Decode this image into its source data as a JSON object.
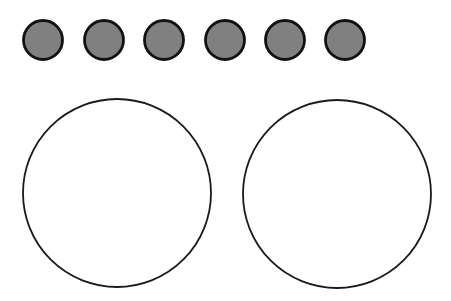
{
  "canvas": {
    "width": 451,
    "height": 301,
    "background": "#ffffff"
  },
  "colors": {
    "small_fill": "#808080",
    "small_stroke": "#111111",
    "large_fill": "#ffffff",
    "large_stroke": "#1a1a1a"
  },
  "small_circles": [
    {
      "cx": 43,
      "cy": 40,
      "r": 19.5
    },
    {
      "cx": 104,
      "cy": 40,
      "r": 19.5
    },
    {
      "cx": 164,
      "cy": 40,
      "r": 19.5
    },
    {
      "cx": 225,
      "cy": 40,
      "r": 19.5
    },
    {
      "cx": 285,
      "cy": 40,
      "r": 19.5
    },
    {
      "cx": 345,
      "cy": 40,
      "r": 19.5
    }
  ],
  "large_circles": [
    {
      "cx": 117,
      "cy": 193,
      "r": 94
    },
    {
      "cx": 337,
      "cy": 194,
      "r": 94
    }
  ]
}
